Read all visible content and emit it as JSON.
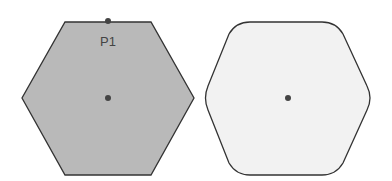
{
  "diagram": {
    "shapes": [
      {
        "name": "sharp-hexagon",
        "fill": "#b9b9b9",
        "stroke": "#333333",
        "corners": "sharp",
        "points": "65,22 151,22 194,98 151,175 65,175 22,98",
        "center": {
          "x": 108,
          "y": 98
        },
        "points_of_interest": [
          {
            "label": "P1",
            "x": 108,
            "y": 21
          }
        ]
      },
      {
        "name": "rounded-hexagon",
        "fill": "#f2f2f2",
        "stroke": "#333333",
        "corners": "rounded",
        "center": {
          "x": 288,
          "y": 98
        }
      }
    ],
    "point_label": "P1",
    "dot_color": "#444444"
  }
}
